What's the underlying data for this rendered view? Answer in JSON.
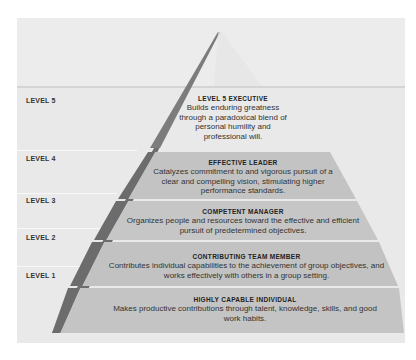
{
  "colors": {
    "background": "#ffffff",
    "panel": "#e9e9e9",
    "pyramid_front": "#c4c4c4",
    "pyramid_side": "#6e6e6e",
    "tier_divider": "#f2f2f2",
    "text": "#2a2a2a"
  },
  "level_labels": [
    "LEVEL 5",
    "LEVEL 4",
    "LEVEL 3",
    "LEVEL 2",
    "LEVEL 1"
  ],
  "tiers": [
    {
      "level": 5,
      "title": "LEVEL 5 EXECUTIVE",
      "description": "Builds enduring greatness through a paradoxical blend of personal humility and professional will."
    },
    {
      "level": 4,
      "title": "EFFECTIVE LEADER",
      "description": "Catalyzes commitment to and vigorous pursuit of a clear and compelling vision, stimulating higher performance standards."
    },
    {
      "level": 3,
      "title": "COMPETENT MANAGER",
      "description": "Organizes people and resources toward the effective and efficient pursuit of predetermined objectives."
    },
    {
      "level": 2,
      "title": "CONTRIBUTING TEAM MEMBER",
      "description": "Contributes individual capabilities to the achievement of group objectives, and works effectively with others in a group setting."
    },
    {
      "level": 1,
      "title": "HIGHLY CAPABLE INDIVIDUAL",
      "description": "Makes productive contributions through talent, knowledge, skills, and good work habits."
    }
  ]
}
